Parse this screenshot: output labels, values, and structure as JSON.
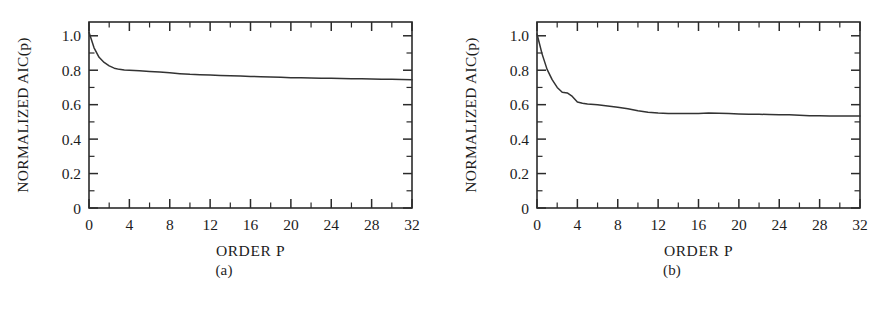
{
  "figure": {
    "background": "#ffffff",
    "ink_color": "#2b2b2b",
    "curve_color": "#333333"
  },
  "panels": [
    {
      "id": "a",
      "caption": "(a)",
      "ylabel": "NORMALIZED AIC(p)",
      "xlabel": "ORDER P"
    },
    {
      "id": "b",
      "caption": "(b)",
      "ylabel": "NORMALIZED AIC(p)",
      "xlabel": "ORDER P"
    }
  ],
  "chart_data": [
    {
      "type": "line",
      "panel": "a",
      "title": "",
      "xlabel": "ORDER P",
      "ylabel": "NORMALIZED AIC(p)",
      "xlim": [
        0,
        32
      ],
      "ylim": [
        0,
        1.08
      ],
      "xticks": [
        0,
        4,
        8,
        12,
        16,
        20,
        24,
        28,
        32
      ],
      "xtick_labels": [
        "0",
        "4",
        "8",
        "12",
        "16",
        "20",
        "24",
        "28",
        "32"
      ],
      "xminor_step": 2,
      "yticks": [
        0,
        0.2,
        0.4,
        0.6,
        0.8,
        1.0
      ],
      "ytick_labels": [
        "0",
        "0.2",
        "0.4",
        "0.6",
        "0.8",
        "1.0"
      ],
      "yminor_step": 0.1,
      "grid": false,
      "legend": "none",
      "ticks_direction": "in",
      "frame": "box",
      "series": [
        {
          "name": "Normalized AIC",
          "x": [
            0,
            0.5,
            1,
            1.5,
            2,
            2.5,
            3,
            3.5,
            4,
            5,
            6,
            7,
            8,
            9,
            10,
            11,
            12,
            13,
            14,
            15,
            16,
            17,
            18,
            19,
            20,
            21,
            22,
            23,
            24,
            25,
            26,
            27,
            28,
            29,
            30,
            31,
            32
          ],
          "y": [
            1.02,
            0.93,
            0.875,
            0.845,
            0.825,
            0.812,
            0.805,
            0.802,
            0.8,
            0.797,
            0.793,
            0.789,
            0.785,
            0.78,
            0.776,
            0.774,
            0.772,
            0.77,
            0.768,
            0.766,
            0.764,
            0.762,
            0.76,
            0.759,
            0.757,
            0.756,
            0.755,
            0.754,
            0.753,
            0.752,
            0.751,
            0.75,
            0.749,
            0.748,
            0.747,
            0.746,
            0.745
          ]
        }
      ]
    },
    {
      "type": "line",
      "panel": "b",
      "title": "",
      "xlabel": "ORDER P",
      "ylabel": "NORMALIZED AIC(p)",
      "xlim": [
        0,
        32
      ],
      "ylim": [
        0,
        1.08
      ],
      "xticks": [
        0,
        4,
        8,
        12,
        16,
        20,
        24,
        28,
        32
      ],
      "xtick_labels": [
        "0",
        "4",
        "8",
        "12",
        "16",
        "20",
        "24",
        "28",
        "32"
      ],
      "xminor_step": 2,
      "yticks": [
        0,
        0.2,
        0.4,
        0.6,
        0.8,
        1.0
      ],
      "ytick_labels": [
        "0",
        "0.2",
        "0.4",
        "0.6",
        "0.8",
        "1.0"
      ],
      "yminor_step": 0.1,
      "grid": false,
      "legend": "none",
      "ticks_direction": "in",
      "frame": "box",
      "series": [
        {
          "name": "Normalized AIC",
          "x": [
            0,
            0.5,
            1,
            1.5,
            2,
            2.5,
            3,
            3.5,
            4,
            4.5,
            5,
            6,
            7,
            8,
            9,
            10,
            11,
            12,
            13,
            14,
            15,
            16,
            17,
            18,
            19,
            20,
            21,
            22,
            23,
            24,
            25,
            26,
            27,
            28,
            29,
            30,
            31,
            32
          ],
          "y": [
            1.01,
            0.895,
            0.805,
            0.745,
            0.7,
            0.672,
            0.668,
            0.648,
            0.616,
            0.608,
            0.604,
            0.6,
            0.592,
            0.585,
            0.576,
            0.565,
            0.556,
            0.551,
            0.549,
            0.548,
            0.548,
            0.549,
            0.551,
            0.55,
            0.548,
            0.546,
            0.545,
            0.544,
            0.543,
            0.542,
            0.541,
            0.539,
            0.536,
            0.535,
            0.534,
            0.534,
            0.534,
            0.534
          ]
        }
      ]
    }
  ]
}
